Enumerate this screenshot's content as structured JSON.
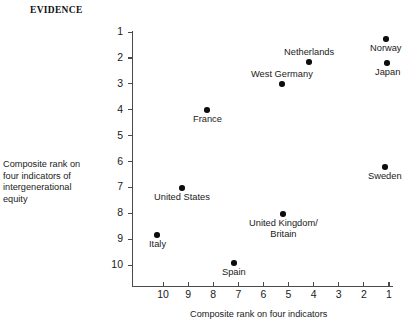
{
  "heading": {
    "text": "EVIDENCE"
  },
  "axes": {
    "y_caption_lines": [
      "Composite rank on",
      "four indicators of",
      "intergenerational",
      "equity"
    ],
    "x_caption": "Composite rank on four indicators"
  },
  "chart_data": {
    "type": "scatter",
    "title": "EVIDENCE",
    "xlabel": "Composite rank on four indicators",
    "ylabel": "Composite rank on four indicators of intergenerational equity",
    "xlim": [
      10.5,
      0.7
    ],
    "ylim": [
      0.6,
      10.6
    ],
    "x_ticks": [
      10,
      9,
      8,
      7,
      6,
      5,
      4,
      3,
      2,
      1
    ],
    "y_ticks": [
      1,
      2,
      3,
      4,
      5,
      6,
      7,
      8,
      9,
      10
    ],
    "x_axis_inverted": true,
    "y_axis_inverted": true,
    "grid": false,
    "legend": "none",
    "points": [
      {
        "label": "Norway",
        "x": 1.1,
        "y": 1.3,
        "label_pos": "below",
        "px": 386,
        "py": 39,
        "lx": 368,
        "ly": 41
      },
      {
        "label": "Japan",
        "x": 1.0,
        "y": 2.2,
        "label_pos": "below",
        "px": 387,
        "py": 63,
        "lx": 369,
        "ly": 65
      },
      {
        "label": "Netherlands",
        "x": 4.2,
        "y": 2.2,
        "label_pos": "above",
        "px": 309,
        "py": 62,
        "lx": 279,
        "ly": 44
      },
      {
        "label": "West Germany",
        "x": 5.3,
        "y": 3.0,
        "label_pos": "above",
        "px": 282,
        "py": 84,
        "lx": 241,
        "ly": 66
      },
      {
        "label": "France",
        "x": 8.2,
        "y": 4.0,
        "label_pos": "below",
        "px": 207,
        "py": 110,
        "lx": 187,
        "ly": 113
      },
      {
        "label": "Sweden",
        "x": 1.4,
        "y": 6.3,
        "label_pos": "below",
        "px": 385,
        "py": 167,
        "lx": 362,
        "ly": 170
      },
      {
        "label": "United States",
        "x": 9.2,
        "y": 7.0,
        "label_pos": "below",
        "px": 182,
        "py": 188,
        "lx": 147,
        "ly": 191
      },
      {
        "label": "United Kingdom/\nBritain",
        "x": 5.2,
        "y": 8.0,
        "label_pos": "below",
        "px": 283,
        "py": 214,
        "lx": 245,
        "ly": 217
      },
      {
        "label": "Italy",
        "x": 10.2,
        "y": 8.8,
        "label_pos": "below",
        "px": 157,
        "py": 235,
        "lx": 142,
        "ly": 238
      },
      {
        "label": "Spain",
        "x": 7.1,
        "y": 9.9,
        "label_pos": "below",
        "px": 234,
        "py": 263,
        "lx": 216,
        "ly": 266
      }
    ]
  }
}
